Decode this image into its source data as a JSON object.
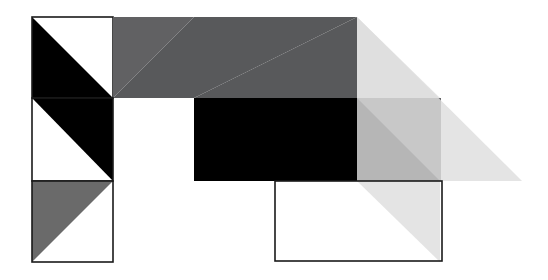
{
  "canvas": {
    "width": 548,
    "height": 280,
    "background": "#ffffff",
    "title": "Geometric Abstract Composition"
  },
  "palette": {
    "black": "#000000",
    "dark_gray": "#58595b",
    "dark_gray_alt": "#616163",
    "medium_gray": "#6a6a6a",
    "right_square_gray": "#636365",
    "light_gray_overlay": "#dedede",
    "white": "#ffffff",
    "outline_stroke": "#1a1a1a"
  },
  "grid": {
    "origin_x": 32,
    "origin_y": 17,
    "cell": 81,
    "columns": 6,
    "rows": 3,
    "stroke_width": 1.6
  },
  "shapes": [
    {
      "id": "cell-r1c1-outline",
      "name": "outlined-square-top-left",
      "type": "rect-outline",
      "x": 32,
      "y": 17,
      "w": 81,
      "h": 81,
      "fill": "none",
      "stroke": "#1a1a1a"
    },
    {
      "id": "cell-r1c1-diagonal",
      "name": "black-triangle-lower-left",
      "type": "triangle",
      "points": "32,17 32,98 113,98",
      "fill": "#000000"
    },
    {
      "id": "cell-r1c2-upper",
      "name": "dark-gray-triangle-upper-right",
      "type": "triangle",
      "points": "113,17 194,17 113,98",
      "fill": "#616163"
    },
    {
      "id": "cell-r1c2-lower",
      "name": "dark-gray-triangle-lower-left",
      "type": "triangle",
      "points": "194,17 194,98 113,98",
      "fill": "#58595b"
    },
    {
      "id": "cell-r1c3",
      "name": "dark-gray-triangle-big-upper-left",
      "type": "triangle",
      "points": "194,17 357,17 194,98",
      "fill": "#58595b"
    },
    {
      "id": "cell-r1c3b",
      "name": "dark-gray-triangle-big-lower",
      "type": "triangle",
      "points": "194,98 357,17 357,98",
      "fill": "#58595b"
    },
    {
      "id": "cell-r2c1-outline",
      "name": "outlined-square-middle-left",
      "type": "rect-outline",
      "x": 32,
      "y": 98,
      "w": 81,
      "h": 83,
      "fill": "none",
      "stroke": "#1a1a1a"
    },
    {
      "id": "cell-r2c1-diagonal",
      "name": "black-triangle-upper-right",
      "type": "triangle",
      "points": "32,98 113,98 113,181",
      "fill": "#000000"
    },
    {
      "id": "cell-r2c34",
      "name": "black-rectangle-center",
      "type": "rect",
      "x": 194,
      "y": 98,
      "w": 163,
      "h": 83,
      "fill": "#000000"
    },
    {
      "id": "cell-r2c4-diagonal",
      "name": "black-triangle-center-right",
      "type": "triangle",
      "points": "357,98 357,181 440,181",
      "fill": "#000000"
    },
    {
      "id": "cell-r3c1-outline",
      "name": "outlined-square-bottom-left",
      "type": "rect-outline",
      "x": 32,
      "y": 181,
      "w": 81,
      "h": 81,
      "fill": "none",
      "stroke": "#1a1a1a"
    },
    {
      "id": "cell-r3c1-diagonal",
      "name": "medium-gray-triangle-lower-left",
      "type": "triangle",
      "points": "32,181 113,181 32,262",
      "fill": "#6a6a6a"
    },
    {
      "id": "cell-r3c4-outline",
      "name": "outlined-square-bottom-right",
      "type": "rect-outline",
      "x": 275,
      "y": 181,
      "w": 167,
      "h": 80,
      "fill": "none",
      "stroke": "#1a1a1a"
    },
    {
      "id": "right-square",
      "name": "dark-gray-square-right",
      "type": "rect",
      "x": 357,
      "y": 98,
      "w": 84,
      "h": 83,
      "fill": "#636365"
    },
    {
      "id": "overlay-triangle",
      "name": "light-gray-transparent-triangle",
      "type": "triangle",
      "points": "357,17 522,181 357,181",
      "fill": "#dedede",
      "opacity": 0.82
    },
    {
      "id": "overlay-triangle-lower",
      "name": "light-gray-transparent-triangle-lower",
      "type": "triangle",
      "points": "357,181 440,181 440,262",
      "fill": "#dedede",
      "opacity": 0.82
    },
    {
      "id": "overlay-triangle-upper-right",
      "name": "light-gray-transparent-triangle-upper",
      "type": "triangle",
      "points": "357,17 357,98 440,98",
      "fill": "#dedede",
      "opacity": 0.82
    }
  ],
  "labels": {
    "alt_text": "Abstract geometric composition of black, gray and outlined squares and triangles on a white background"
  }
}
